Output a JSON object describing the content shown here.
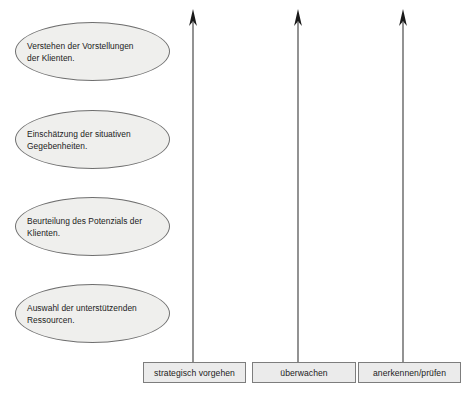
{
  "diagram": {
    "type": "process-flow",
    "background_color": "#ffffff",
    "ellipse_fill": "#efefed",
    "ellipse_stroke": "#6f6f6f",
    "box_fill": "#ebebeb",
    "box_stroke": "#7d7d7d",
    "text_color": "#1b1b1b",
    "arrow_color": "#3a3a3a",
    "stages": [
      {
        "id": "stage-1",
        "line1": "Verstehen der Vorstellungen",
        "line2": "der Klienten.",
        "text": "Verstehen der Vorstellungen\nder Klienten."
      },
      {
        "id": "stage-2",
        "line1": "Einschätzung der situativen",
        "line2": "Gegebenheiten.",
        "text": "Einschätzung der situativen\nGegebenheiten."
      },
      {
        "id": "stage-3",
        "line1": "Beurteilung des Potenzials der",
        "line2": "Klienten.",
        "text": "Beurteilung des Potenzials der\nKlienten."
      },
      {
        "id": "stage-4",
        "line1": "Auswahl der unterstützenden",
        "line2": "Ressourcen.",
        "text": "Auswahl der unterstützenden\nRessourcen."
      }
    ],
    "columns": [
      {
        "id": "column-1",
        "label": "strategisch vorgehen",
        "arrow": "arrow-up-icon"
      },
      {
        "id": "column-2",
        "label": "überwachen",
        "arrow": "arrow-up-icon"
      },
      {
        "id": "column-3",
        "label": "anerkennen/prüfen",
        "arrow": "arrow-up-icon"
      }
    ]
  }
}
